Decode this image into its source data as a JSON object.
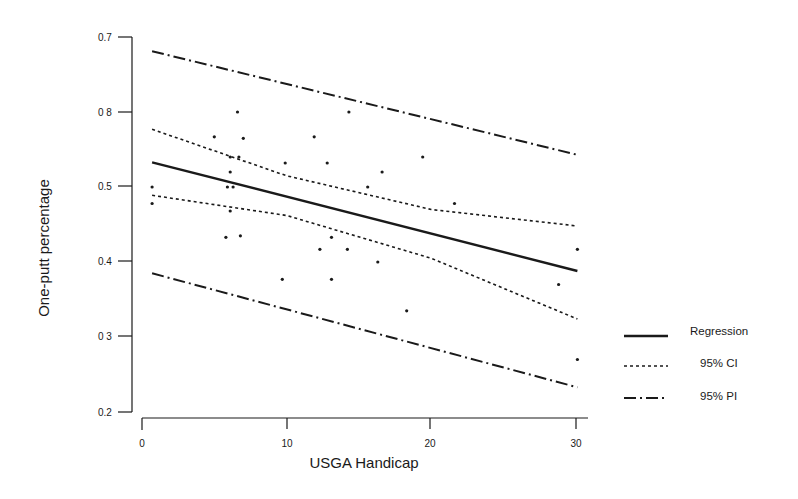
{
  "chart_data": {
    "type": "scatter",
    "title": "",
    "xlabel": "USGA Handicap",
    "ylabel": "One-putt percentage",
    "xlim": [
      0,
      30
    ],
    "ylim": [
      0.2,
      0.7
    ],
    "x_ticks": [
      0,
      10,
      20,
      30
    ],
    "x_tick_labels": [
      "0",
      "10",
      "20",
      "30"
    ],
    "y_ticks": [
      0.2,
      0.3,
      0.4,
      0.5,
      0.6,
      0.7
    ],
    "y_tick_labels": [
      "0.2",
      "0 3",
      "0.4",
      "0.5",
      "0 8",
      "0.7"
    ],
    "grid": false,
    "legend_position": "right",
    "points": [
      {
        "x": 0.7,
        "y": 0.5
      },
      {
        "x": 0.7,
        "y": 0.478
      },
      {
        "x": 5.0,
        "y": 0.567
      },
      {
        "x": 5.8,
        "y": 0.433
      },
      {
        "x": 5.9,
        "y": 0.5
      },
      {
        "x": 6.1,
        "y": 0.54
      },
      {
        "x": 6.1,
        "y": 0.52
      },
      {
        "x": 6.1,
        "y": 0.468
      },
      {
        "x": 6.3,
        "y": 0.5
      },
      {
        "x": 6.6,
        "y": 0.6
      },
      {
        "x": 6.7,
        "y": 0.54
      },
      {
        "x": 6.8,
        "y": 0.435
      },
      {
        "x": 7.0,
        "y": 0.565
      },
      {
        "x": 9.7,
        "y": 0.377
      },
      {
        "x": 9.9,
        "y": 0.532
      },
      {
        "x": 11.9,
        "y": 0.567
      },
      {
        "x": 12.3,
        "y": 0.417
      },
      {
        "x": 12.8,
        "y": 0.532
      },
      {
        "x": 13.1,
        "y": 0.433
      },
      {
        "x": 13.1,
        "y": 0.377
      },
      {
        "x": 14.2,
        "y": 0.417
      },
      {
        "x": 14.3,
        "y": 0.6
      },
      {
        "x": 15.6,
        "y": 0.5
      },
      {
        "x": 16.3,
        "y": 0.4
      },
      {
        "x": 16.6,
        "y": 0.52
      },
      {
        "x": 18.3,
        "y": 0.335
      },
      {
        "x": 19.4,
        "y": 0.54
      },
      {
        "x": 21.6,
        "y": 0.478
      },
      {
        "x": 28.8,
        "y": 0.37
      },
      {
        "x": 30.1,
        "y": 0.417
      },
      {
        "x": 30.1,
        "y": 0.27
      }
    ],
    "series": [
      {
        "name": "Regression",
        "style": "solid",
        "x": [
          0.7,
          30.1
        ],
        "values": [
          0.533,
          0.388
        ]
      },
      {
        "name": "95% CI upper",
        "style": "dotted",
        "x": [
          0.7,
          10,
          20,
          30.1
        ],
        "values": [
          0.577,
          0.515,
          0.47,
          0.448
        ]
      },
      {
        "name": "95% CI lower",
        "style": "dotted",
        "x": [
          0.7,
          10,
          20,
          30.1
        ],
        "values": [
          0.489,
          0.462,
          0.405,
          0.324
        ]
      },
      {
        "name": "95% PI upper",
        "style": "dashdot",
        "x": [
          0.7,
          30.1
        ],
        "values": [
          0.681,
          0.543
        ]
      },
      {
        "name": "95% PI lower",
        "style": "dashdot",
        "x": [
          0.7,
          30.1
        ],
        "values": [
          0.385,
          0.233
        ]
      }
    ],
    "legend": [
      {
        "label": "Regression",
        "style": "solid"
      },
      {
        "label": "95% CI",
        "style": "dotted"
      },
      {
        "label": "95% PI",
        "style": "dashdot"
      }
    ]
  },
  "axes": {
    "x_title": "USGA Handicap",
    "y_title": "One-putt percentage",
    "x_ticks": [
      {
        "label": "0"
      },
      {
        "label": "10"
      },
      {
        "label": "20"
      },
      {
        "label": "30"
      }
    ],
    "y_ticks": [
      {
        "label": "0.7"
      },
      {
        "label": "0 8"
      },
      {
        "label": "0.5"
      },
      {
        "label": "0.4"
      },
      {
        "label": "0 3"
      },
      {
        "label": "0.2"
      }
    ]
  },
  "legend": {
    "items": [
      {
        "label": "Regression"
      },
      {
        "label": "95% CI"
      },
      {
        "label": "95% PI"
      }
    ]
  },
  "colors": {
    "ink": "#1a1a1a",
    "background": "#ffffff"
  }
}
